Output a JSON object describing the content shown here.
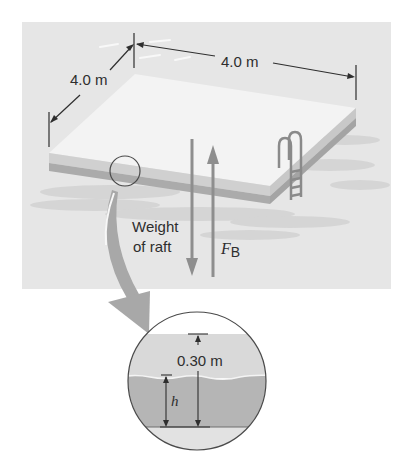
{
  "figure": {
    "dimension_depth_label": "4.0 m",
    "dimension_width_label": "4.0 m",
    "weight_label_line1": "Weight",
    "weight_label_line2": "of raft",
    "buoyant_force_symbol": "F",
    "buoyant_force_subscript": "B",
    "inset": {
      "thickness_label": "0.30 m",
      "submerged_depth_symbol": "h"
    }
  },
  "colors": {
    "background_panel": "#e6e6e6",
    "raft_top": "#f2f2f2",
    "raft_edge_light": "#cfcfcf",
    "raft_edge_dark": "#a9a9a9",
    "water_shadow": "#d2d2d2",
    "arrow_gray": "#8e8e8e",
    "curved_arrow": "#a8a8a8",
    "inset_raft_above_water": "#d9d9d9",
    "inset_raft_submerged": "#b5b5b5",
    "inset_water_below": "#e2e2e2",
    "line_dark": "#3a3a3a"
  }
}
